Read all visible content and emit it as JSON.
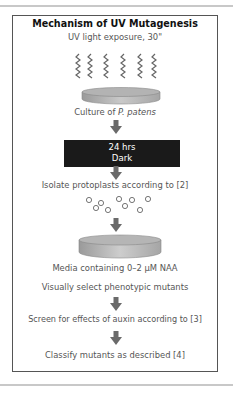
{
  "diagram": {
    "title": "Mechanism of UV Mutagenesis",
    "steps": {
      "uv_exposure": "UV light exposure, 30\"",
      "culture_prefix": "Culture of ",
      "culture_species": "P. patens",
      "incubation_line1": "24 hrs",
      "incubation_line2": "Dark",
      "isolate": "Isolate protoplasts according to [2]",
      "media": "Media containing 0–2 µM NAA",
      "select": "Visually select phenotypic mutants",
      "screen": "Screen for effects of auxin according to [3]",
      "classify": "Classify mutants as described [4]"
    },
    "icons": {
      "uv_waves": "wavy-line-icon",
      "dish": "petri-dish-icon",
      "protoplasts": "circle-icon",
      "arrow": "down-arrow-icon"
    },
    "colors": {
      "frame_border": "#555555",
      "dark_box": "#1a1a1a",
      "arrow": "#6a6a6a",
      "dish": "#b8b8b8",
      "text": "#555555",
      "title": "#111111"
    }
  }
}
